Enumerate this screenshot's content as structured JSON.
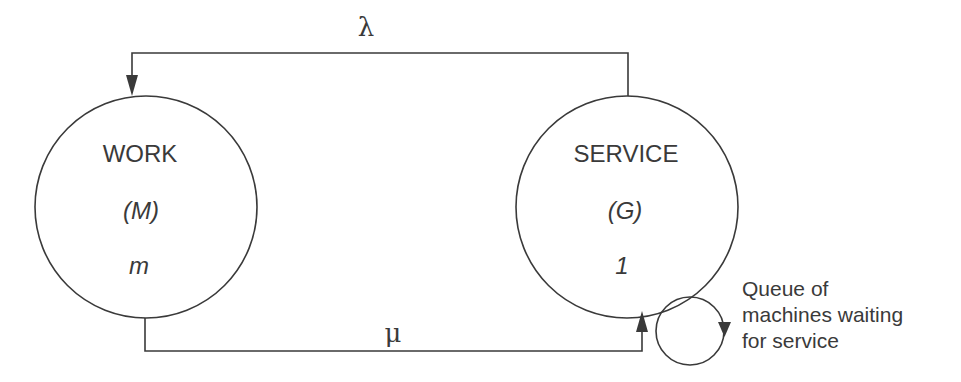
{
  "diagram": {
    "type": "machine-interference queueing model",
    "nodes": {
      "work": {
        "title": "WORK",
        "distribution": "(M)",
        "count": "m"
      },
      "service": {
        "title": "SERVICE",
        "distribution": "(G)",
        "count": "1"
      }
    },
    "edges": {
      "top": {
        "label": "λ",
        "from": "service",
        "to": "work"
      },
      "bottom": {
        "label": "μ",
        "from": "work",
        "to": "service"
      }
    },
    "queue": {
      "label_lines": [
        "Queue of",
        "machines waiting",
        "for service"
      ]
    },
    "colors": {
      "stroke": "#3a3a3a",
      "background": "#ffffff"
    }
  }
}
